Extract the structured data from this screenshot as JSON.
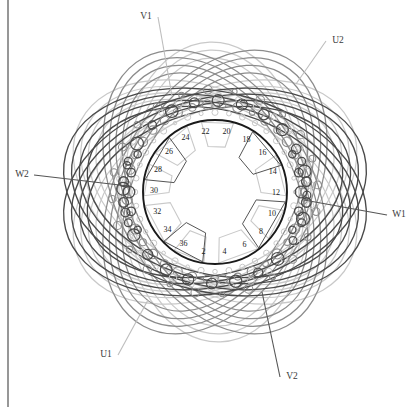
{
  "figure": {
    "type": "stator-winding-diagram",
    "colors": {
      "dark": "#4a4a4a",
      "medium": "#8c8c8c",
      "light": "#c9c9c9",
      "bore": "#1a1a1a",
      "text": "#333333",
      "border": "#6b6b6b"
    },
    "geometry": {
      "center_x": 215,
      "center_y": 192,
      "bore_radius": 72,
      "coil_ring_radius": 88
    }
  },
  "terminals": [
    {
      "id": "V1",
      "label": "V1",
      "x": 146,
      "y": 16,
      "lx": 172,
      "ly": 96,
      "tone": "light"
    },
    {
      "id": "U2",
      "label": "U2",
      "x": 338,
      "y": 40,
      "lx": 296,
      "ly": 84,
      "tone": "light"
    },
    {
      "id": "W2",
      "label": "W2",
      "x": 22,
      "y": 174,
      "lx": 128,
      "ly": 186,
      "tone": "dark"
    },
    {
      "id": "W1",
      "label": "W1",
      "x": 399,
      "y": 214,
      "lx": 304,
      "ly": 200,
      "tone": "dark"
    },
    {
      "id": "U1",
      "label": "U1",
      "x": 106,
      "y": 354,
      "lx": 148,
      "ly": 300,
      "tone": "light"
    },
    {
      "id": "V2",
      "label": "V2",
      "x": 292,
      "y": 376,
      "lx": 262,
      "ly": 292,
      "tone": "dark"
    }
  ],
  "slot_numbers": [
    {
      "n": "2",
      "angle": 101
    },
    {
      "n": "4",
      "angle": 81
    },
    {
      "n": "6",
      "angle": 61
    },
    {
      "n": "8",
      "angle": 41
    },
    {
      "n": "10",
      "angle": 21
    },
    {
      "n": "12",
      "angle": 1
    },
    {
      "n": "14",
      "angle": -19
    },
    {
      "n": "16",
      "angle": -39
    },
    {
      "n": "18",
      "angle": -59
    },
    {
      "n": "20",
      "angle": -79
    },
    {
      "n": "22",
      "angle": -99
    },
    {
      "n": "24",
      "angle": -119
    },
    {
      "n": "26",
      "angle": -139
    },
    {
      "n": "28",
      "angle": -159
    },
    {
      "n": "30",
      "angle": -179
    },
    {
      "n": "32",
      "angle": 161
    },
    {
      "n": "34",
      "angle": 141
    },
    {
      "n": "36",
      "angle": 121
    }
  ],
  "legend": {
    "phases": [
      "U",
      "V",
      "W"
    ],
    "slot_count": 36
  }
}
